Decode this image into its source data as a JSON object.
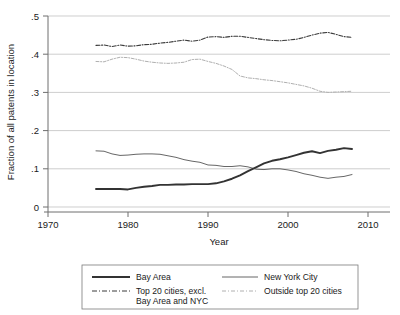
{
  "chart_data": {
    "type": "line",
    "title": "",
    "xlabel": "Year",
    "ylabel": "Fraction of all patents in location",
    "xlim": [
      1970,
      2010
    ],
    "ylim": [
      0,
      0.5
    ],
    "xticks": [
      "1970",
      "1980",
      "1990",
      "2000",
      "2010"
    ],
    "xtick_values": [
      1970,
      1980,
      1990,
      2000,
      2010
    ],
    "yticks": [
      "0",
      ".1",
      ".2",
      ".3",
      ".4",
      ".5"
    ],
    "ytick_values": [
      0,
      0.1,
      0.2,
      0.3,
      0.4,
      0.5
    ],
    "grid": "horizontal",
    "legend_position": "below",
    "x": [
      1976,
      1977,
      1978,
      1979,
      1980,
      1981,
      1982,
      1983,
      1984,
      1985,
      1986,
      1987,
      1988,
      1989,
      1990,
      1991,
      1992,
      1993,
      1994,
      1995,
      1996,
      1997,
      1998,
      1999,
      2000,
      2001,
      2002,
      2003,
      2004,
      2005,
      2006,
      2007,
      2008
    ],
    "series": [
      {
        "name": "Bay Area",
        "style": "solid-thick",
        "color": "#333333",
        "values": [
          0.047,
          0.047,
          0.047,
          0.047,
          0.046,
          0.05,
          0.053,
          0.055,
          0.058,
          0.058,
          0.059,
          0.059,
          0.06,
          0.06,
          0.06,
          0.062,
          0.067,
          0.074,
          0.083,
          0.094,
          0.104,
          0.114,
          0.121,
          0.125,
          0.13,
          0.136,
          0.142,
          0.146,
          0.141,
          0.147,
          0.15,
          0.154,
          0.152
        ]
      },
      {
        "name": "New York City",
        "style": "solid-thin",
        "color": "#555555",
        "values": [
          0.147,
          0.146,
          0.139,
          0.135,
          0.136,
          0.138,
          0.139,
          0.139,
          0.138,
          0.134,
          0.13,
          0.124,
          0.12,
          0.117,
          0.11,
          0.109,
          0.106,
          0.106,
          0.108,
          0.105,
          0.099,
          0.098,
          0.1,
          0.1,
          0.097,
          0.093,
          0.087,
          0.083,
          0.078,
          0.075,
          0.078,
          0.08,
          0.085
        ]
      },
      {
        "name": "Top 20 cities, excl. Bay Area and NYC",
        "style": "dash-dot",
        "color": "#3a3a3a",
        "values": [
          0.423,
          0.424,
          0.42,
          0.424,
          0.421,
          0.422,
          0.425,
          0.426,
          0.429,
          0.431,
          0.434,
          0.437,
          0.434,
          0.437,
          0.445,
          0.446,
          0.444,
          0.447,
          0.447,
          0.444,
          0.441,
          0.438,
          0.436,
          0.435,
          0.437,
          0.439,
          0.444,
          0.45,
          0.455,
          0.457,
          0.452,
          0.446,
          0.444
        ]
      },
      {
        "name": "Outside top 20 cities",
        "style": "dotted-light",
        "color": "#b0b0b0",
        "values": [
          0.381,
          0.38,
          0.387,
          0.392,
          0.391,
          0.387,
          0.382,
          0.379,
          0.377,
          0.376,
          0.377,
          0.379,
          0.386,
          0.387,
          0.381,
          0.376,
          0.369,
          0.36,
          0.343,
          0.338,
          0.336,
          0.333,
          0.331,
          0.328,
          0.325,
          0.321,
          0.317,
          0.311,
          0.303,
          0.3,
          0.301,
          0.302,
          0.303
        ]
      }
    ]
  },
  "legend": {
    "entries": [
      {
        "label": "Bay Area",
        "style": "solid-thick"
      },
      {
        "label": "New York City",
        "style": "solid-thin"
      },
      {
        "label": "Top 20 cities, excl.",
        "label2": "Bay Area and NYC",
        "style": "dash-dot"
      },
      {
        "label": "Outside top 20 cities",
        "style": "dotted-light"
      }
    ]
  },
  "colors": {
    "bay_area": "#333333",
    "new_york_city": "#555555",
    "top20": "#3a3a3a",
    "outside": "#b0b0b0",
    "gridline": "#b9b9b9",
    "axis": "#6e6e6e",
    "text": "#1a1a1a",
    "background": "#ffffff"
  }
}
